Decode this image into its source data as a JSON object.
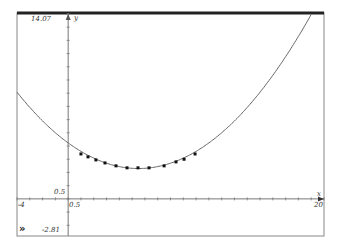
{
  "window": {
    "expand_icon": "»"
  },
  "axes": {
    "x_min_label": "-4",
    "x_max_label": "20",
    "x_origin_label": "0.5",
    "y_max_label": "14.07",
    "y_min_label": "-2.81",
    "y_origin_label": "0.5",
    "x_axis_name": "x",
    "y_axis_name": "y"
  },
  "chart_data": {
    "type": "scatter",
    "title": "",
    "xlabel": "x",
    "ylabel": "y",
    "xlim": [
      -4,
      20
    ],
    "ylim": [
      -2.81,
      14.07
    ],
    "grid": false,
    "series": [
      {
        "name": "data points",
        "kind": "scatter",
        "x": [
          1.0,
          1.55,
          2.17,
          2.88,
          3.74,
          4.6,
          5.46,
          6.32,
          7.5,
          8.43,
          9.06,
          9.92
        ],
        "y": [
          3.4,
          3.18,
          2.95,
          2.72,
          2.5,
          2.35,
          2.35,
          2.35,
          2.5,
          2.8,
          3.0,
          3.4
        ]
      },
      {
        "name": "fitted curve",
        "kind": "line",
        "model": "quadratic",
        "vertex": [
          5.5,
          2.3
        ],
        "a": 0.064
      }
    ]
  }
}
